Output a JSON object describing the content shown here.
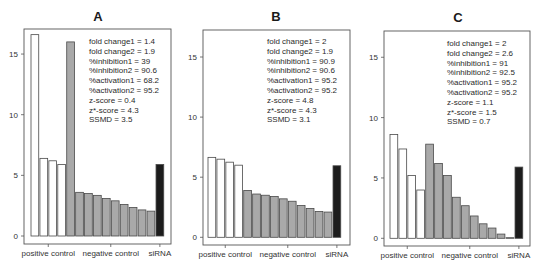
{
  "chart_data": [
    {
      "type": "bar",
      "title": "A",
      "xlabel": "",
      "ylabel": "",
      "ylim": [
        0,
        17
      ],
      "yticks": [
        0,
        5,
        10,
        15
      ],
      "grid": false,
      "group_labels": [
        "positive control",
        "negative control",
        "siRNA"
      ],
      "series": [
        {
          "name": "positive control",
          "color": "#ffffff",
          "values": [
            16.6,
            6.4,
            6.2,
            5.9
          ]
        },
        {
          "name": "negative control",
          "color": "#a9a9a9",
          "values": [
            16.0,
            3.6,
            3.5,
            3.35,
            3.1,
            2.9,
            2.6,
            2.35,
            2.15,
            2.05
          ]
        },
        {
          "name": "siRNA",
          "color": "#1c1c1c",
          "values": [
            5.9
          ]
        }
      ],
      "annotations": [
        "fold change1 = 1.4",
        "fold change2 = 1.9",
        "%inhibition1 = 39",
        "%inhibition2 = 90.6",
        "%activation1 = 68.2",
        "%activation2 = 95.2",
        "z-score = 0.4",
        "z*-score = 4.3",
        "SSMD = 3.5"
      ]
    },
    {
      "type": "bar",
      "title": "B",
      "xlabel": "",
      "ylabel": "",
      "ylim": [
        0,
        17
      ],
      "yticks": [
        0,
        5,
        10,
        15
      ],
      "grid": false,
      "group_labels": [
        "positive control",
        "negative control",
        "siRNA"
      ],
      "series": [
        {
          "name": "positive control",
          "color": "#ffffff",
          "values": [
            6.65,
            6.5,
            6.25,
            6.0
          ]
        },
        {
          "name": "negative control",
          "color": "#a9a9a9",
          "values": [
            3.9,
            3.6,
            3.5,
            3.4,
            3.2,
            3.0,
            2.65,
            2.4,
            2.15,
            2.1
          ]
        },
        {
          "name": "siRNA",
          "color": "#1c1c1c",
          "values": [
            5.95
          ]
        }
      ],
      "annotations": [
        "fold change1 = 2",
        "fold change2 = 1.9",
        "%inhibition1 = 90.9",
        "%inhibition2 = 90.6",
        "%activation1 = 95.2",
        "%activation2 = 95.2",
        "z-score = 4.8",
        "z*-score = 4.3",
        "SSMD = 3.1"
      ]
    },
    {
      "type": "bar",
      "title": "C",
      "xlabel": "",
      "ylabel": "",
      "ylim": [
        0,
        17
      ],
      "yticks": [
        0,
        5,
        10,
        15
      ],
      "grid": false,
      "group_labels": [
        "positive control",
        "negative control",
        "siRNA"
      ],
      "series": [
        {
          "name": "positive control",
          "color": "#ffffff",
          "values": [
            8.6,
            7.4,
            5.2,
            4.0
          ]
        },
        {
          "name": "negative control",
          "color": "#a9a9a9",
          "values": [
            7.8,
            6.2,
            5.2,
            3.4,
            2.7,
            1.85,
            1.2,
            0.85,
            0.35,
            0.05
          ]
        },
        {
          "name": "siRNA",
          "color": "#1c1c1c",
          "values": [
            5.9
          ]
        }
      ],
      "annotations": [
        "fold change1 = 2",
        "fold change2 = 2.6",
        "%inhibition1 = 91",
        "%inhibition2 = 92.5",
        "%activation1 = 95.2",
        "%activation2 = 95.2",
        "z-score = 1.1",
        "z*-score = 1.5",
        "SSMD = 0.7"
      ]
    }
  ],
  "layout": {
    "panels": [
      {
        "box": [
          24,
          29,
          171,
          244
        ],
        "zero_y": 236,
        "px_per_unit": 12.13,
        "bar_x0": 31,
        "bar_pitch": 8.93,
        "title_xy": [
          98,
          21
        ],
        "annot_xy": [
          89,
          44
        ]
      },
      {
        "box": [
          203,
          30,
          350,
          245
        ],
        "zero_y": 237.3,
        "px_per_unit": 12.02,
        "bar_x0": 208,
        "bar_pitch": 8.93,
        "title_xy": [
          276,
          21
        ],
        "annot_xy": [
          267,
          44
        ]
      },
      {
        "box": [
          384,
          31,
          530,
          246
        ],
        "zero_y": 238.3,
        "px_per_unit": 12.07,
        "bar_x0": 390,
        "bar_pitch": 8.93,
        "title_xy": [
          458,
          22
        ],
        "annot_xy": [
          447,
          46
        ]
      }
    ],
    "annot_line_height": 9.8,
    "stroke_color": "#555555"
  }
}
